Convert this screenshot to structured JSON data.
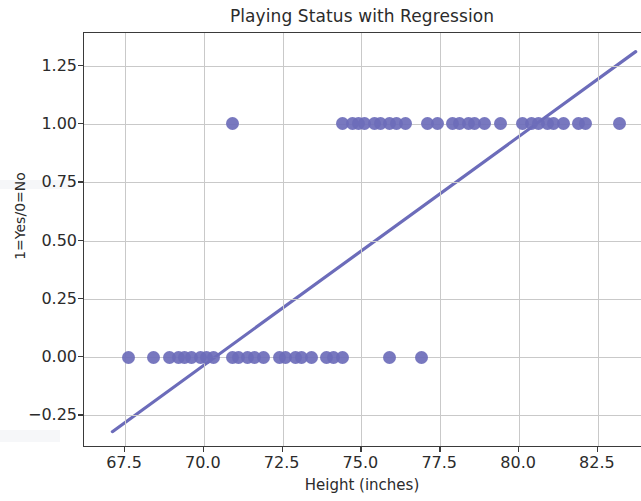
{
  "chart_data": {
    "type": "scatter",
    "title": "Playing Status with Regression",
    "xlabel": "Height (inches)",
    "ylabel": "1=Yes/0=No",
    "xlim": [
      66.2,
      83.9
    ],
    "ylim": [
      -0.39,
      1.39
    ],
    "xticks": [
      67.5,
      70.0,
      72.5,
      75.0,
      77.5,
      80.0,
      82.5
    ],
    "xtick_labels": [
      "67.5",
      "70.0",
      "72.5",
      "75.0",
      "77.5",
      "80.0",
      "82.5"
    ],
    "yticks": [
      -0.25,
      0.0,
      0.25,
      0.5,
      0.75,
      1.0,
      1.25
    ],
    "ytick_labels": [
      "−0.25",
      "0.00",
      "0.25",
      "0.50",
      "0.75",
      "1.00",
      "1.25"
    ],
    "grid": true,
    "legend": null,
    "marker_color": "#6c6cba",
    "line_color": "#6c6cba",
    "series": [
      {
        "name": "Playing status",
        "type": "scatter",
        "x": [
          67.6,
          68.4,
          68.9,
          69.2,
          69.4,
          69.6,
          69.9,
          70.1,
          70.3,
          70.9,
          71.1,
          71.4,
          71.6,
          71.9,
          72.4,
          72.6,
          72.9,
          73.1,
          73.4,
          73.9,
          74.1,
          74.4,
          75.9,
          76.9,
          70.9,
          74.4,
          74.7,
          74.9,
          75.1,
          75.4,
          75.6,
          75.9,
          76.1,
          76.4,
          77.1,
          77.4,
          77.9,
          78.1,
          78.4,
          78.6,
          78.9,
          79.4,
          80.1,
          80.4,
          80.6,
          80.9,
          81.1,
          81.4,
          81.9,
          82.1,
          83.2
        ],
        "y": [
          0,
          0,
          0,
          0,
          0,
          0,
          0,
          0,
          0,
          0,
          0,
          0,
          0,
          0,
          0,
          0,
          0,
          0,
          0,
          0,
          0,
          0,
          0,
          0,
          1,
          1,
          1,
          1,
          1,
          1,
          1,
          1,
          1,
          1,
          1,
          1,
          1,
          1,
          1,
          1,
          1,
          1,
          1,
          1,
          1,
          1,
          1,
          1,
          1,
          1,
          1
        ]
      },
      {
        "name": "Regression line",
        "type": "line",
        "x_endpoints": [
          67.1,
          83.7
        ],
        "y_endpoints": [
          -0.32,
          1.31
        ]
      }
    ]
  },
  "figure": {
    "title": "Playing Status with Regression",
    "x_axis_label": "Height (inches)",
    "y_axis_label": "1=Yes/0=No"
  }
}
